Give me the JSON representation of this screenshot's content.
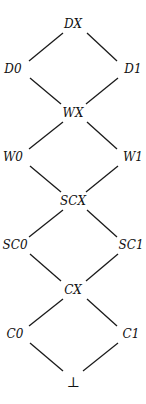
{
  "diagram": {
    "type": "hasse-lattice",
    "nodes": [
      {
        "id": "DX",
        "label": "DX",
        "x": 73,
        "y": 24
      },
      {
        "id": "D0",
        "label": "D0",
        "x": 13,
        "y": 69
      },
      {
        "id": "D1",
        "label": "D1",
        "x": 133,
        "y": 69
      },
      {
        "id": "WX",
        "label": "WX",
        "x": 73,
        "y": 113
      },
      {
        "id": "W0",
        "label": "W0",
        "x": 13,
        "y": 157
      },
      {
        "id": "W1",
        "label": "W1",
        "x": 133,
        "y": 157
      },
      {
        "id": "SCX",
        "label": "SCX",
        "x": 73,
        "y": 201
      },
      {
        "id": "SC0",
        "label": "SC0",
        "x": 13,
        "y": 245
      },
      {
        "id": "SC1",
        "label": "SC1",
        "x": 133,
        "y": 245
      },
      {
        "id": "CX",
        "label": "CX",
        "x": 73,
        "y": 290
      },
      {
        "id": "C0",
        "label": "C0",
        "x": 13,
        "y": 334
      },
      {
        "id": "C1",
        "label": "C1",
        "x": 133,
        "y": 334
      },
      {
        "id": "BOT",
        "label": "⊥",
        "x": 73,
        "y": 382
      }
    ],
    "edges": [
      {
        "from": "DX",
        "to": "D0",
        "x1": 63,
        "y1": 33,
        "x2": 29,
        "y2": 61
      },
      {
        "from": "DX",
        "to": "D1",
        "x1": 87,
        "y1": 33,
        "x2": 117,
        "y2": 61
      },
      {
        "from": "D0",
        "to": "WX",
        "x1": 30,
        "y1": 78,
        "x2": 61,
        "y2": 104
      },
      {
        "from": "D1",
        "to": "WX",
        "x1": 118,
        "y1": 78,
        "x2": 86,
        "y2": 104
      },
      {
        "from": "WX",
        "to": "W0",
        "x1": 63,
        "y1": 122,
        "x2": 29,
        "y2": 149
      },
      {
        "from": "WX",
        "to": "W1",
        "x1": 87,
        "y1": 122,
        "x2": 117,
        "y2": 149
      },
      {
        "from": "W0",
        "to": "SCX",
        "x1": 30,
        "y1": 166,
        "x2": 61,
        "y2": 192
      },
      {
        "from": "W1",
        "to": "SCX",
        "x1": 118,
        "y1": 166,
        "x2": 86,
        "y2": 192
      },
      {
        "from": "SCX",
        "to": "SC0",
        "x1": 63,
        "y1": 210,
        "x2": 29,
        "y2": 237
      },
      {
        "from": "SCX",
        "to": "SC1",
        "x1": 87,
        "y1": 210,
        "x2": 117,
        "y2": 237
      },
      {
        "from": "SC0",
        "to": "CX",
        "x1": 30,
        "y1": 254,
        "x2": 61,
        "y2": 281
      },
      {
        "from": "SC1",
        "to": "CX",
        "x1": 118,
        "y1": 254,
        "x2": 86,
        "y2": 281
      },
      {
        "from": "CX",
        "to": "C0",
        "x1": 63,
        "y1": 299,
        "x2": 29,
        "y2": 326
      },
      {
        "from": "CX",
        "to": "C1",
        "x1": 87,
        "y1": 299,
        "x2": 117,
        "y2": 326
      },
      {
        "from": "C0",
        "to": "BOT",
        "x1": 30,
        "y1": 343,
        "x2": 63,
        "y2": 371
      },
      {
        "from": "C1",
        "to": "BOT",
        "x1": 118,
        "y1": 343,
        "x2": 83,
        "y2": 371
      }
    ]
  },
  "labels": {
    "DX": "DX",
    "D0": "D0",
    "D1": "D1",
    "WX": "WX",
    "W0": "W0",
    "W1": "W1",
    "SCX": "SCX",
    "SC0": "SC0",
    "SC1": "SC1",
    "CX": "CX",
    "C0": "C0",
    "C1": "C1",
    "BOT": "⊥"
  }
}
